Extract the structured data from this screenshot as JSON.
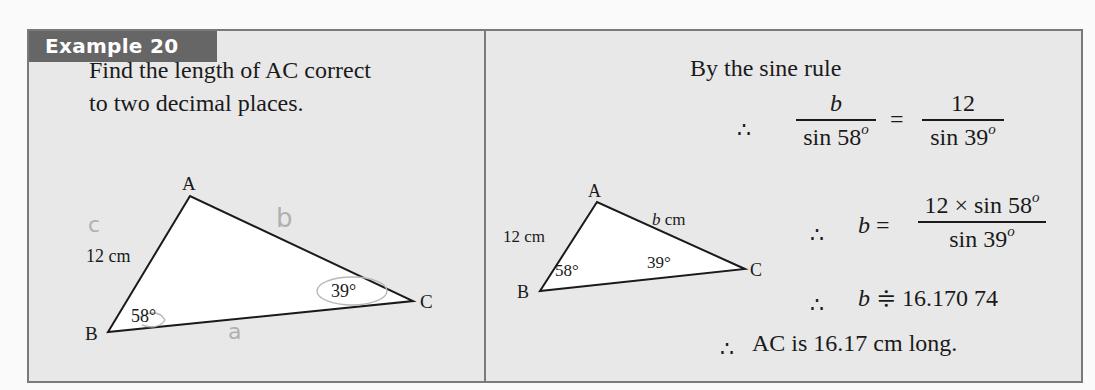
{
  "example": {
    "badge": "Example 20",
    "question_line1_pre": "Find the length of ",
    "question_line1_ac": "AC",
    "question_line1_post": " correct",
    "question_line2": "to two decimal places."
  },
  "left_figure": {
    "vertices": {
      "A": "A",
      "B": "B",
      "C": "C"
    },
    "side_label": "12 cm",
    "angle_B": "58°",
    "angle_C": "39°",
    "handwritten": {
      "side_c": "c",
      "side_b": "b",
      "side_a": "a"
    }
  },
  "right_figure": {
    "vertices": {
      "A": "A",
      "B": "B",
      "C": "C"
    },
    "side_AB": "12 cm",
    "side_AC_var": "b",
    "side_AC_unit": " cm",
    "angle_B": "58°",
    "angle_C": "39°"
  },
  "solution": {
    "intro": "By the sine rule",
    "therefore": "∴",
    "eq1": {
      "lhs_num": "b",
      "lhs_den": "sin 58",
      "equals": "=",
      "rhs_num": "12",
      "rhs_den": "sin 39",
      "deg": "o"
    },
    "eq2": {
      "lhs": "b",
      "equals": "=",
      "num": "12 × sin 58",
      "den": "sin 39",
      "deg": "o"
    },
    "eq3": {
      "lhs": "b",
      "approx": "≑",
      "value": "16.170 74"
    },
    "conclusion": "AC is 16.17 cm long."
  }
}
